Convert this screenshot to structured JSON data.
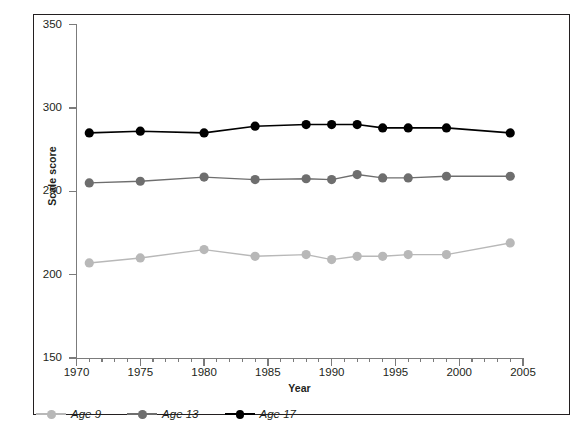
{
  "chart_data": {
    "type": "line",
    "title": "",
    "xlabel": "Year",
    "ylabel": "Scale score",
    "xlim": [
      1970,
      2005
    ],
    "ylim": [
      150,
      350
    ],
    "yticks": [
      150,
      200,
      250,
      300,
      350
    ],
    "xticks": [
      1970,
      1975,
      1980,
      1985,
      1990,
      1995,
      2000,
      2005
    ],
    "minor_xtick_interval": 1,
    "grid": false,
    "legend_position": "below-left",
    "x": [
      1971,
      1975,
      1980,
      1984,
      1988,
      1990,
      1992,
      1994,
      1996,
      1999,
      2004
    ],
    "series": [
      {
        "name": "Age 9",
        "color": "#b8b8b8",
        "x": [
          1971,
          1975,
          1980,
          1984,
          1988,
          1990,
          1992,
          1994,
          1996,
          1999,
          2004
        ],
        "values": [
          207,
          210,
          215,
          211,
          212,
          209,
          211,
          211,
          212,
          212,
          219
        ]
      },
      {
        "name": "Age 13",
        "color": "#6e6e6e",
        "x": [
          1971,
          1975,
          1980,
          1984,
          1988,
          1990,
          1992,
          1994,
          1996,
          1999,
          2004
        ],
        "values": [
          255,
          256,
          258.5,
          257,
          257.5,
          257,
          260,
          258,
          258,
          259,
          259
        ]
      },
      {
        "name": "Age 17",
        "color": "#000000",
        "x": [
          1971,
          1975,
          1980,
          1984,
          1988,
          1990,
          1992,
          1994,
          1996,
          1999,
          2004
        ],
        "values": [
          285,
          286,
          285,
          289,
          290,
          290,
          290,
          288,
          288,
          288,
          285
        ]
      }
    ]
  },
  "axes": {
    "y_tick_labels": [
      "350",
      "300",
      "250",
      "200",
      "150"
    ],
    "x_tick_labels": [
      "1970",
      "1975",
      "1980",
      "1985",
      "1990",
      "1995",
      "2000",
      "2005"
    ],
    "x_axis_title": "Year",
    "y_axis_title": "Scale score"
  },
  "legend": {
    "items": [
      {
        "label": "Age 9",
        "color": "#b8b8b8"
      },
      {
        "label": "Age 13",
        "color": "#6e6e6e"
      },
      {
        "label": "Age 17",
        "color": "#000000"
      }
    ]
  }
}
